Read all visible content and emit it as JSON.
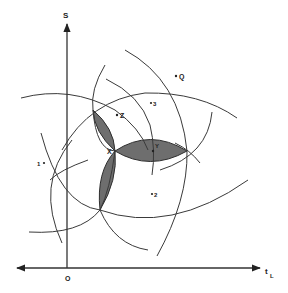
{
  "diagram": {
    "axes": {
      "y_label": "S",
      "x_label": "t",
      "x_label_sub": "L",
      "origin_label": "O"
    },
    "points": {
      "q": "Q",
      "three": "3",
      "z": "Z",
      "one": "1",
      "two": "2",
      "x": "X",
      "y": "Y"
    },
    "colors": {
      "stroke": "#3a3a3a",
      "shading": "#6e6e6e",
      "background": "#ffffff"
    }
  }
}
